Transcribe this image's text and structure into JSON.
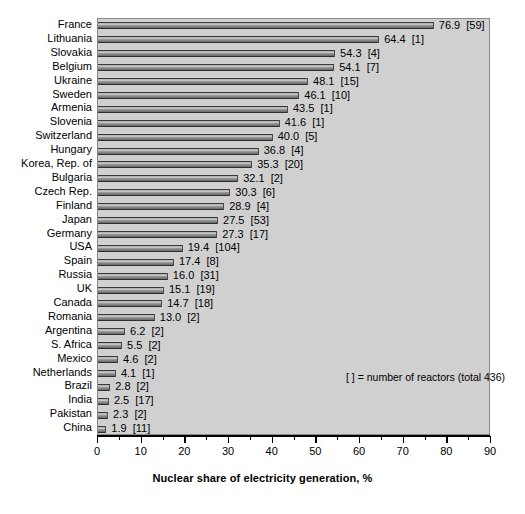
{
  "chart_data": {
    "type": "bar",
    "orientation": "horizontal",
    "title": "",
    "xlabel": "Nuclear share of electricity generation, %",
    "ylabel": "",
    "xlim": [
      0,
      90
    ],
    "xticks": [
      0,
      10,
      20,
      30,
      40,
      50,
      60,
      70,
      80,
      90
    ],
    "xtick_labels": [
      "0",
      "10",
      "20",
      "30",
      "40",
      "50",
      "60",
      "70",
      "80",
      "90"
    ],
    "minor_tick_interval": 5,
    "grid": false,
    "legend_position": "inside-center-right",
    "annotation": "[ ]  = number of reactors (total 436)",
    "total_reactors": 436,
    "value_label_format": "{value} [{reactors}]",
    "categories": [
      "France",
      "Lithuania",
      "Slovakia",
      "Belgium",
      "Ukraine",
      "Sweden",
      "Armenia",
      "Slovenia",
      "Switzerland",
      "Hungary",
      "Korea, Rep. of",
      "Bulgaria",
      "Czech Rep.",
      "Finland",
      "Japan",
      "Germany",
      "USA",
      "Spain",
      "Russia",
      "UK",
      "Canada",
      "Romania",
      "Argentina",
      "S. Africa",
      "Mexico",
      "Netherlands",
      "Brazil",
      "India",
      "Pakistan",
      "China"
    ],
    "values": [
      76.9,
      64.4,
      54.3,
      54.1,
      48.1,
      46.1,
      43.5,
      41.6,
      40.0,
      36.8,
      35.3,
      32.1,
      30.3,
      28.9,
      27.5,
      27.3,
      19.4,
      17.4,
      16.0,
      15.1,
      14.7,
      13.0,
      6.2,
      5.5,
      4.6,
      4.1,
      2.8,
      2.5,
      2.3,
      1.9
    ],
    "reactors": [
      59,
      1,
      4,
      7,
      15,
      10,
      1,
      1,
      5,
      4,
      20,
      2,
      6,
      4,
      53,
      17,
      104,
      8,
      31,
      19,
      18,
      2,
      2,
      2,
      2,
      1,
      2,
      17,
      2,
      11
    ],
    "value_labels": [
      "76.9  [59]",
      "64.4  [1]",
      "54.3  [4]",
      "54.1  [7]",
      "48.1  [15]",
      "46.1  [10]",
      "43.5  [1]",
      "41.6  [1]",
      "40.0  [5]",
      "36.8  [4]",
      "35.3  [20]",
      "32.1  [2]",
      "30.3  [6]",
      "28.9  [4]",
      "27.5  [53]",
      "27.3  [17]",
      "19.4  [104]",
      "17.4  [8]",
      "16.0  [31]",
      "15.1  [19]",
      "14.7  [18]",
      "13.0  [2]",
      "6.2  [2]",
      "5.5  [2]",
      "4.6  [2]",
      "4.1  [1]",
      "2.8  [2]",
      "2.5  [17]",
      "2.3  [2]",
      "1.9  [11]"
    ],
    "colors": {
      "plot_background": "#d0d0d0",
      "figure_background": "#ffffff",
      "bar_dark": "#2e2e2e",
      "bar_light": "#cfcfcf",
      "axis": "#000000",
      "text": "#000000"
    }
  }
}
